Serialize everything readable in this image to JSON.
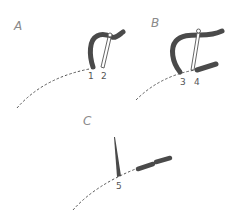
{
  "figure": {
    "panels": [
      {
        "id": "A",
        "label": "A",
        "markers": [
          "1",
          "2"
        ]
      },
      {
        "id": "B",
        "label": "B",
        "markers": [
          "3",
          "4"
        ]
      },
      {
        "id": "C",
        "label": "C",
        "markers": [
          "5"
        ]
      }
    ],
    "colors": {
      "tube": "#4a4a4a",
      "dashed_line": "#555555",
      "label": "#8a8a8a",
      "background": "#ffffff"
    }
  }
}
